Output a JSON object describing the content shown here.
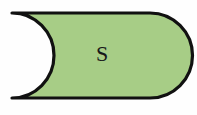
{
  "canvas": {
    "width": 197,
    "height": 115,
    "background_color": "#fefefe"
  },
  "diagram": {
    "shape": {
      "name": "delay-symbol",
      "description": "Rectangle with convex rounded right cap and concave semicircular notch on the left side",
      "fill_color": "#a7cd86",
      "stroke_color": "#111111",
      "stroke_width": 3.2,
      "label": "S",
      "label_color": "#17181a",
      "geometry": {
        "left_x": 12,
        "right_x": 180,
        "top_y": 13,
        "bottom_y": 98,
        "notch_apex_x": 54,
        "cap_start_x": 150
      }
    }
  },
  "label": {
    "text": "S"
  }
}
